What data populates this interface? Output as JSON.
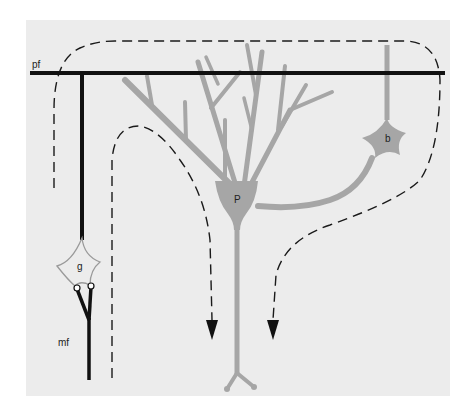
{
  "diagram": {
    "type": "cerebellar-circuit-schematic",
    "background_panel_color": "#ececec",
    "colors": {
      "fiber_black": "#111111",
      "neuron_gray": "#a6a6a6",
      "dashed_path": "#1a1a1a",
      "granule_outline": "#9a9a9a"
    },
    "labels": {
      "parallel_fiber": "pf",
      "granule_cell": "g",
      "purkinje_cell": "P",
      "basket_cell": "b",
      "mossy_fiber": "mf"
    },
    "elements": [
      {
        "id": "parallel-fiber",
        "label": "pf",
        "kind": "horizontal black fiber"
      },
      {
        "id": "granule-cell",
        "label": "g",
        "kind": "star-shaped soma, outlined"
      },
      {
        "id": "mossy-fiber",
        "label": "mf",
        "kind": "black fiber branching into two terminals"
      },
      {
        "id": "purkinje-cell",
        "label": "P",
        "kind": "gray soma with dendritic tree and descending axon"
      },
      {
        "id": "basket-cell",
        "label": "b",
        "kind": "gray star soma with ascending dendrite and axon to P"
      },
      {
        "id": "dashed-pathways",
        "label": "",
        "kind": "three dashed signal-flow arrows pointing downward"
      }
    ]
  }
}
